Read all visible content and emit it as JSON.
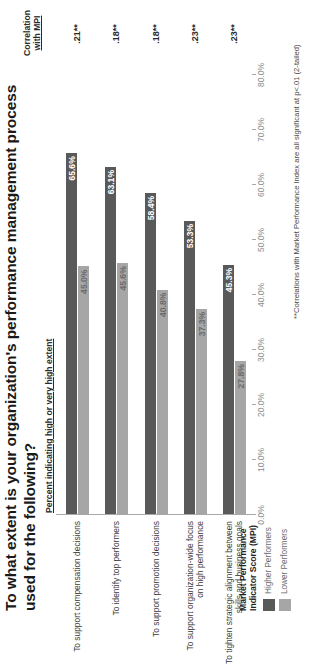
{
  "slide": {
    "title_line1": "To what extent is your organization's performance management process",
    "title_line2": "used for the following?",
    "footnote": "**Correlations with Market Performance Index are all significant at  p<.01 (2-tailed)"
  },
  "headers": {
    "percent_header": "Percent indicating high or very high extent",
    "correlation_header_line1": "Correlation",
    "correlation_header_line2": "with MPI"
  },
  "legend": {
    "title_line1": "Market Performance",
    "title_line2": "Indicator Score (MPI)",
    "items": [
      {
        "label": "Higher Performers",
        "color": "#595959"
      },
      {
        "label": "Lower Performers",
        "color": "#a6a6a6"
      }
    ]
  },
  "chart_data": {
    "type": "bar",
    "title": "To what extent is your organization's performance management process used for the following?",
    "xlabel": "",
    "ylabel": "Percent indicating high or very high extent",
    "ylim": [
      0,
      80
    ],
    "grid": false,
    "legend_position": "bottom-left",
    "tick_labels": [
      "0.0%",
      "10.0%",
      "20.0%",
      "30.0%",
      "40.0%",
      "50.0%",
      "60.0%",
      "70.0%",
      "80.0%"
    ],
    "tick_values": [
      0,
      10,
      20,
      30,
      40,
      50,
      60,
      70,
      80
    ],
    "categories": [
      "To support compensation decisions",
      "To identify top performers",
      "To support promotion decisions",
      "To support organization-wide focus on high performance",
      "To tighten strategic alignment between skills and business goals"
    ],
    "category_lines": [
      [
        "To support compensation decisions"
      ],
      [
        "To identify top performers"
      ],
      [
        "To support promotion decisions"
      ],
      [
        "To support organization-wide focus",
        "on high performance"
      ],
      [
        "To tighten strategic alignment between",
        "skills and business goals"
      ]
    ],
    "series": [
      {
        "name": "Higher Performers",
        "color": "#595959",
        "values": [
          65.6,
          63.1,
          58.4,
          53.3,
          45.3
        ],
        "labels": [
          "65.6%",
          "63.1%",
          "58.4%",
          "53.3%",
          "45.3%"
        ]
      },
      {
        "name": "Lower Performers",
        "color": "#a6a6a6",
        "values": [
          45.0,
          45.6,
          40.8,
          37.3,
          27.8
        ],
        "labels": [
          "45.0%",
          "45.6%",
          "40.8%",
          "37.3%",
          "27.8%"
        ]
      }
    ],
    "annotations": {
      "correlation_with_mpi": [
        ".21**",
        ".18**",
        ".18**",
        ".23**",
        ".23**"
      ]
    }
  }
}
